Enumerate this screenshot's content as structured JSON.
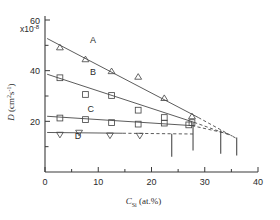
{
  "chart_data": {
    "type": "scatter",
    "title": "",
    "xlabel": "C_Si (at.%)",
    "xlabel_base": "C",
    "xlabel_sub": "Si",
    "xlabel_rest": " (at.%)",
    "ylabel": "D (cm2s-1)",
    "ylabel_base": "D",
    "ylabel_rest": " (cm",
    "ylabel_sup1": "2",
    "ylabel_mid": "s",
    "ylabel_sup2": "-1",
    "ylabel_end": ")",
    "y_multiplier": "x10",
    "y_multiplier_exp": "-8",
    "xlim": [
      0,
      40
    ],
    "ylim": [
      0,
      60
    ],
    "xticks": [
      0,
      10,
      20,
      30,
      40
    ],
    "xtick_labels": [
      "0",
      "10",
      "20",
      "30",
      "40"
    ],
    "xminor": [
      5,
      15,
      25,
      35
    ],
    "yticks": [
      20,
      40,
      60
    ],
    "ytick_labels": [
      "20",
      "40",
      "60"
    ],
    "yminor": [
      10,
      30,
      50
    ],
    "grid": false,
    "legend_position": "inline-curve-labels",
    "series": [
      {
        "name": "A",
        "label": "A",
        "marker": "triangle-up",
        "label_x": 9.0,
        "label_y": 51.0,
        "points": [
          {
            "x": 2.8,
            "y": 49.2
          },
          {
            "x": 7.6,
            "y": 44.5
          },
          {
            "x": 12.5,
            "y": 39.8
          },
          {
            "x": 17.5,
            "y": 37.6
          },
          {
            "x": 22.4,
            "y": 29.2
          },
          {
            "x": 27.6,
            "y": 22.0
          }
        ],
        "fit_solid": {
          "x1": 0.4,
          "y1": 52.7,
          "x2": 28.8,
          "y2": 21.5
        },
        "fit_dashed": {
          "x1": 28.8,
          "y1": 21.5,
          "x2": 36.0,
          "y2": 13.2
        }
      },
      {
        "name": "B",
        "label": "B",
        "marker": "square",
        "label_x": 9.0,
        "label_y": 38.3,
        "points": [
          {
            "x": 2.8,
            "y": 37.2
          },
          {
            "x": 7.6,
            "y": 30.6
          },
          {
            "x": 12.5,
            "y": 30.2
          },
          {
            "x": 17.5,
            "y": 24.4
          },
          {
            "x": 22.4,
            "y": 21.5
          },
          {
            "x": 27.6,
            "y": 19.5
          }
        ],
        "fit_solid": {
          "x1": 0.4,
          "y1": 38.6,
          "x2": 28.0,
          "y2": 19.6
        },
        "fit_dashed": {
          "x1": 28.0,
          "y1": 19.6,
          "x2": 35.2,
          "y2": 14.2
        }
      },
      {
        "name": "C",
        "label": "C",
        "marker": "square",
        "label_x": 8.6,
        "label_y": 23.6,
        "points": [
          {
            "x": 2.8,
            "y": 21.3
          },
          {
            "x": 7.6,
            "y": 20.7
          },
          {
            "x": 12.5,
            "y": 19.5
          },
          {
            "x": 17.5,
            "y": 18.9
          },
          {
            "x": 22.4,
            "y": 19.3
          },
          {
            "x": 27.0,
            "y": 18.6
          }
        ],
        "fit_solid": {
          "x1": 0.4,
          "y1": 22.0,
          "x2": 27.6,
          "y2": 18.3
        },
        "fit_dashed": {
          "x1": 27.6,
          "y1": 18.3,
          "x2": 34.6,
          "y2": 15.0
        }
      },
      {
        "name": "D",
        "label": "D",
        "marker": "triangle-down",
        "label_x": 6.2,
        "label_y": 13.0,
        "points": [
          {
            "x": 2.8,
            "y": 14.7
          },
          {
            "x": 6.4,
            "y": 15.5
          },
          {
            "x": 12.2,
            "y": 14.4
          },
          {
            "x": 17.8,
            "y": 14.3
          }
        ],
        "fit_solid": {
          "x1": 0.4,
          "y1": 15.6,
          "x2": 14.6,
          "y2": 15.3
        },
        "fit_dashed": {
          "x1": 14.6,
          "y1": 15.3,
          "x2": 27.8,
          "y2": 15.0
        }
      }
    ],
    "limit_markers": [
      {
        "x": 23.8,
        "y_top": 15.1,
        "y_bottom": 6.0
      },
      {
        "x": 27.8,
        "y_top": 19.6,
        "y_bottom": 8.5
      },
      {
        "x": 33.0,
        "y_top": 16.5,
        "y_bottom": 7.2
      },
      {
        "x": 36.0,
        "y_top": 13.6,
        "y_bottom": 6.5
      }
    ]
  }
}
